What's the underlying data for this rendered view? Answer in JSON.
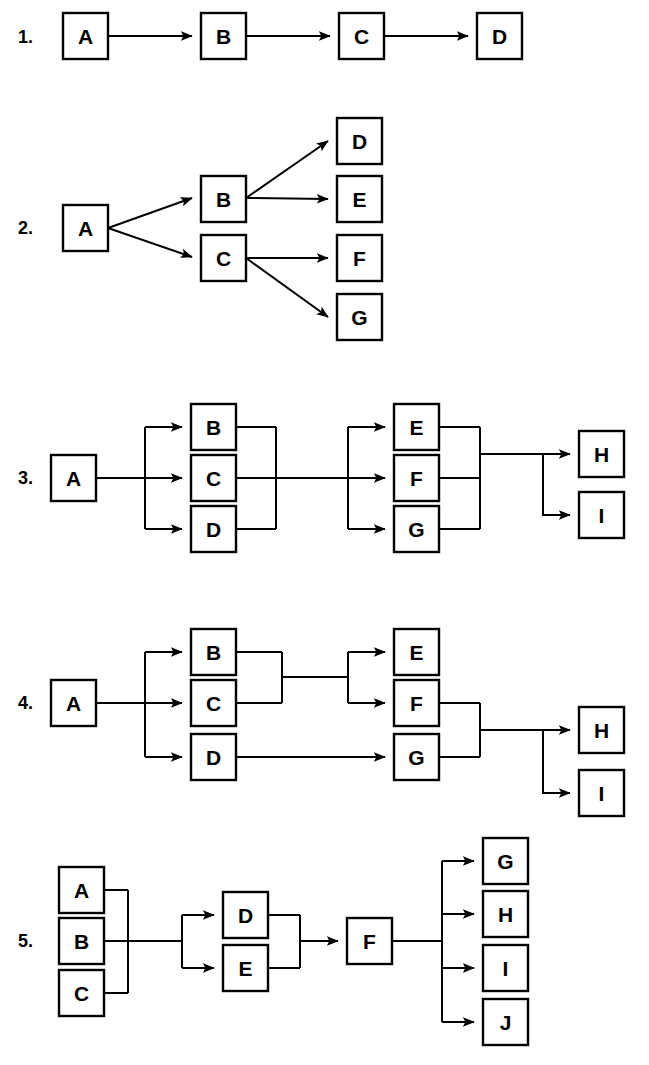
{
  "figure": {
    "background_color": "#ffffff",
    "line_color": "#000000",
    "node_fill": "#ffffff",
    "width": 649,
    "height": 1065
  },
  "rows": [
    {
      "number": "1.",
      "pattern": "sequence",
      "nodes": [
        "A",
        "B",
        "C",
        "D"
      ],
      "edges": [
        [
          "A",
          "B"
        ],
        [
          "B",
          "C"
        ],
        [
          "C",
          "D"
        ]
      ]
    },
    {
      "number": "2.",
      "pattern": "binary-tree-fanout",
      "nodes": [
        "A",
        "B",
        "C",
        "D",
        "E",
        "F",
        "G"
      ],
      "edges": [
        [
          "A",
          "B"
        ],
        [
          "A",
          "C"
        ],
        [
          "B",
          "D"
        ],
        [
          "B",
          "E"
        ],
        [
          "C",
          "F"
        ],
        [
          "C",
          "G"
        ]
      ]
    },
    {
      "number": "3.",
      "pattern": "parallel-split-join-then-split",
      "nodes": [
        "A",
        "B",
        "C",
        "D",
        "E",
        "F",
        "G",
        "H",
        "I"
      ],
      "edges": [
        [
          "A",
          "B"
        ],
        [
          "A",
          "C"
        ],
        [
          "A",
          "D"
        ],
        [
          "B",
          "join1"
        ],
        [
          "C",
          "join1"
        ],
        [
          "D",
          "join1"
        ],
        [
          "join1",
          "E"
        ],
        [
          "join1",
          "F"
        ],
        [
          "join1",
          "G"
        ],
        [
          "E",
          "join2"
        ],
        [
          "F",
          "join2"
        ],
        [
          "G",
          "join2"
        ],
        [
          "join2",
          "H"
        ],
        [
          "join2",
          "I"
        ]
      ]
    },
    {
      "number": "4.",
      "pattern": "mixed-parallel-branches",
      "nodes": [
        "A",
        "B",
        "C",
        "D",
        "E",
        "F",
        "G",
        "H",
        "I"
      ],
      "edges": [
        [
          "A",
          "B"
        ],
        [
          "A",
          "C"
        ],
        [
          "A",
          "D"
        ],
        [
          "B",
          "join1"
        ],
        [
          "C",
          "join1"
        ],
        [
          "join1",
          "E"
        ],
        [
          "join1",
          "F"
        ],
        [
          "D",
          "G"
        ],
        [
          "F",
          "join2"
        ],
        [
          "G",
          "join2"
        ],
        [
          "join2",
          "H"
        ],
        [
          "join2",
          "I"
        ]
      ]
    },
    {
      "number": "5.",
      "pattern": "merge-split-merge-fanout",
      "nodes": [
        "A",
        "B",
        "C",
        "D",
        "E",
        "F",
        "G",
        "H",
        "I",
        "J"
      ],
      "edges": [
        [
          "A",
          "merge1"
        ],
        [
          "B",
          "merge1"
        ],
        [
          "C",
          "merge1"
        ],
        [
          "merge1",
          "D"
        ],
        [
          "merge1",
          "E"
        ],
        [
          "D",
          "merge2"
        ],
        [
          "E",
          "merge2"
        ],
        [
          "merge2",
          "F"
        ],
        [
          "F",
          "G"
        ],
        [
          "F",
          "H"
        ],
        [
          "F",
          "I"
        ],
        [
          "F",
          "J"
        ]
      ]
    }
  ],
  "node_labels": {
    "r1": {
      "n0": "A",
      "n1": "B",
      "n2": "C",
      "n3": "D"
    },
    "r2": {
      "n0": "A",
      "n1": "B",
      "n2": "C",
      "n3": "D",
      "n4": "E",
      "n5": "F",
      "n6": "G"
    },
    "r3": {
      "n0": "A",
      "n1": "B",
      "n2": "C",
      "n3": "D",
      "n4": "E",
      "n5": "F",
      "n6": "G",
      "n7": "H",
      "n8": "I"
    },
    "r4": {
      "n0": "A",
      "n1": "B",
      "n2": "C",
      "n3": "D",
      "n4": "E",
      "n5": "F",
      "n6": "G",
      "n7": "H",
      "n8": "I"
    },
    "r5": {
      "n0": "A",
      "n1": "B",
      "n2": "C",
      "n3": "D",
      "n4": "E",
      "n5": "F",
      "n6": "G",
      "n7": "H",
      "n8": "I",
      "n9": "J"
    }
  },
  "row_numbers": {
    "r1": "1.",
    "r2": "2.",
    "r3": "3.",
    "r4": "4.",
    "r5": "5."
  }
}
